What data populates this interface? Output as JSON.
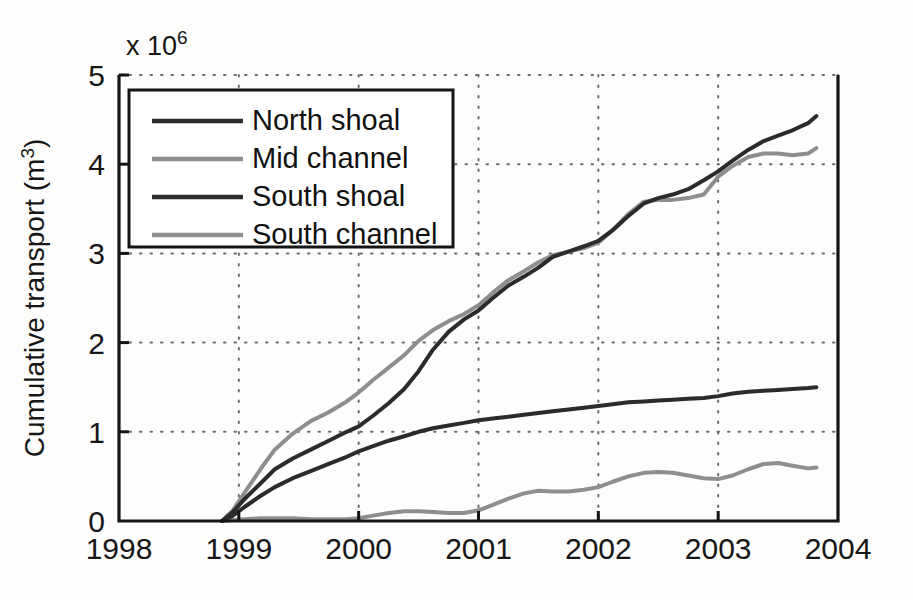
{
  "figure": {
    "background": "#fdfdfc",
    "plot_area": {
      "left": 119,
      "top": 75,
      "right": 838,
      "bottom": 521
    }
  },
  "axis": {
    "y_title_main": "Cumulative transport (m",
    "y_title_unit": "3",
    "y_title_close": ")",
    "exponent_prefix": "x 10",
    "exponent_value": "6",
    "y_ticks": [
      "0",
      "1",
      "2",
      "3",
      "4",
      "5"
    ],
    "x_ticks": [
      "1998",
      "1999",
      "2000",
      "2001",
      "2002",
      "2003",
      "2004"
    ]
  },
  "legend": {
    "entries": [
      {
        "label": "North shoal",
        "color": "#2b2b2b"
      },
      {
        "label": "Mid channel",
        "color": "#8e8e8e"
      },
      {
        "label": "South shoal",
        "color": "#2b2b2b"
      },
      {
        "label": "South channel",
        "color": "#8e8e8e"
      }
    ]
  },
  "chart_data": {
    "type": "line",
    "title": "",
    "xlabel": "",
    "ylabel": "Cumulative transport (m^3)",
    "y_scale_exponent": 1000000,
    "y_scale_label": "x 10^6",
    "xlim": [
      1998,
      2004
    ],
    "ylim": [
      0,
      5000000
    ],
    "ytick_values": [
      0,
      1000000,
      2000000,
      3000000,
      4000000,
      5000000
    ],
    "xtick_values": [
      1998,
      1999,
      2000,
      2001,
      2002,
      2003,
      2004
    ],
    "grid": true,
    "grid_style": "dotted",
    "legend_position": "upper-left-inside",
    "units": "m^3",
    "series": [
      {
        "name": "North shoal",
        "color": "#2b2b2b",
        "x": [
          1998.86,
          1998.95,
          1999.05,
          1999.18,
          1999.3,
          1999.45,
          1999.6,
          1999.75,
          1999.9,
          2000.0,
          2000.12,
          2000.25,
          2000.38,
          2000.5,
          2000.62,
          2000.75,
          2000.88,
          2001.0,
          2001.12,
          2001.25,
          2001.38,
          2001.5,
          2001.62,
          2001.75,
          2001.88,
          2002.0,
          2002.12,
          2002.25,
          2002.38,
          2002.5,
          2002.62,
          2002.75,
          2002.88,
          2003.0,
          2003.12,
          2003.25,
          2003.38,
          2003.5,
          2003.62,
          2003.75,
          2003.82
        ],
        "y": [
          0.0,
          0.1,
          0.25,
          0.42,
          0.58,
          0.7,
          0.8,
          0.9,
          1.0,
          1.06,
          1.18,
          1.32,
          1.48,
          1.68,
          1.92,
          2.12,
          2.26,
          2.36,
          2.5,
          2.64,
          2.74,
          2.84,
          2.96,
          3.02,
          3.08,
          3.14,
          3.26,
          3.42,
          3.56,
          3.62,
          3.66,
          3.72,
          3.82,
          3.92,
          4.04,
          4.16,
          4.26,
          4.32,
          4.38,
          4.46,
          4.54
        ],
        "y_units": "millions of m^3"
      },
      {
        "name": "Mid channel",
        "color": "#8e8e8e",
        "x": [
          1998.86,
          1998.95,
          1999.05,
          1999.18,
          1999.3,
          1999.45,
          1999.6,
          1999.75,
          1999.9,
          2000.0,
          2000.12,
          2000.25,
          2000.38,
          2000.5,
          2000.62,
          2000.75,
          2000.88,
          2001.0,
          2001.12,
          2001.25,
          2001.38,
          2001.5,
          2001.62,
          2001.75,
          2001.88,
          2002.0,
          2002.12,
          2002.25,
          2002.38,
          2002.5,
          2002.62,
          2002.75,
          2002.88,
          2003.0,
          2003.12,
          2003.25,
          2003.38,
          2003.5,
          2003.62,
          2003.75,
          2003.82
        ],
        "y": [
          0.0,
          0.12,
          0.32,
          0.58,
          0.8,
          0.98,
          1.12,
          1.22,
          1.34,
          1.44,
          1.58,
          1.72,
          1.86,
          2.02,
          2.14,
          2.24,
          2.32,
          2.42,
          2.56,
          2.7,
          2.8,
          2.9,
          2.98,
          3.02,
          3.06,
          3.12,
          3.26,
          3.44,
          3.58,
          3.6,
          3.6,
          3.62,
          3.66,
          3.86,
          3.98,
          4.08,
          4.12,
          4.12,
          4.1,
          4.12,
          4.18
        ],
        "y_units": "millions of m^3"
      },
      {
        "name": "South shoal",
        "color": "#2b2b2b",
        "x": [
          1998.86,
          1998.95,
          1999.05,
          1999.18,
          1999.3,
          1999.45,
          1999.6,
          1999.75,
          1999.9,
          2000.0,
          2000.12,
          2000.25,
          2000.38,
          2000.5,
          2000.62,
          2000.75,
          2000.88,
          2001.0,
          2001.12,
          2001.25,
          2001.38,
          2001.5,
          2001.62,
          2001.75,
          2001.88,
          2002.0,
          2002.12,
          2002.25,
          2002.38,
          2002.5,
          2002.62,
          2002.75,
          2002.88,
          2003.0,
          2003.12,
          2003.25,
          2003.38,
          2003.5,
          2003.62,
          2003.75,
          2003.82
        ],
        "y": [
          0.0,
          0.06,
          0.16,
          0.28,
          0.38,
          0.48,
          0.56,
          0.64,
          0.72,
          0.78,
          0.84,
          0.9,
          0.95,
          1.0,
          1.04,
          1.07,
          1.1,
          1.13,
          1.15,
          1.17,
          1.19,
          1.21,
          1.23,
          1.25,
          1.27,
          1.29,
          1.31,
          1.33,
          1.34,
          1.35,
          1.36,
          1.37,
          1.38,
          1.4,
          1.43,
          1.45,
          1.46,
          1.47,
          1.48,
          1.49,
          1.5
        ],
        "y_units": "millions of m^3"
      },
      {
        "name": "South channel",
        "color": "#8e8e8e",
        "x": [
          1998.86,
          1998.95,
          1999.05,
          1999.18,
          1999.3,
          1999.45,
          1999.6,
          1999.75,
          1999.9,
          2000.0,
          2000.12,
          2000.25,
          2000.38,
          2000.5,
          2000.62,
          2000.75,
          2000.88,
          2001.0,
          2001.12,
          2001.25,
          2001.38,
          2001.5,
          2001.62,
          2001.75,
          2001.88,
          2002.0,
          2002.12,
          2002.25,
          2002.38,
          2002.5,
          2002.62,
          2002.75,
          2002.88,
          2003.0,
          2003.12,
          2003.25,
          2003.38,
          2003.5,
          2003.62,
          2003.75,
          2003.82
        ],
        "y": [
          0.0,
          0.01,
          0.02,
          0.03,
          0.03,
          0.03,
          0.02,
          0.02,
          0.02,
          0.03,
          0.06,
          0.09,
          0.11,
          0.11,
          0.1,
          0.09,
          0.09,
          0.12,
          0.18,
          0.25,
          0.31,
          0.34,
          0.33,
          0.33,
          0.35,
          0.38,
          0.44,
          0.5,
          0.54,
          0.55,
          0.54,
          0.51,
          0.48,
          0.47,
          0.51,
          0.58,
          0.64,
          0.65,
          0.62,
          0.59,
          0.6
        ],
        "y_units": "millions of m^3"
      }
    ]
  }
}
